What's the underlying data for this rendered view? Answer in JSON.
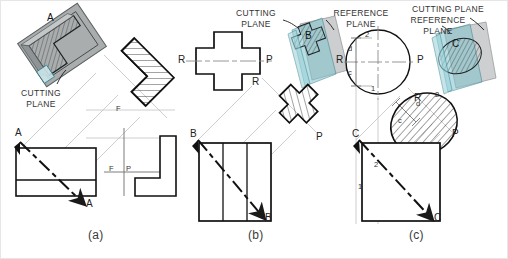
{
  "figure": {
    "panels": [
      {
        "id": "a",
        "caption": "(a)",
        "object": "L-shaped block",
        "pictorial_labels": [
          "A"
        ],
        "annotations": [
          "CUTTING PLANE"
        ],
        "cutting_plane_label": "A",
        "cutting_plane_ends": [
          "A",
          "A"
        ],
        "fold_line_labels": [
          "F",
          "F",
          "P"
        ],
        "section_view": "hatched L-shaped auxiliary section"
      },
      {
        "id": "b",
        "caption": "(b)",
        "object": "Cross / plus-shaped block",
        "pictorial_labels": [
          "B"
        ],
        "annotations": [
          "CUTTING PLANE",
          "REFERENCE PLANE"
        ],
        "cutting_plane_label": "B",
        "cutting_plane_ends": [
          "B",
          "B"
        ],
        "reference_line_labels": [
          "R",
          "P",
          "R",
          "R",
          "P"
        ],
        "section_view": "hatched cross-shaped auxiliary section"
      },
      {
        "id": "c",
        "caption": "(c)",
        "object": "Cylinder / circular block",
        "pictorial_labels": [
          "C"
        ],
        "annotations": [
          "CUTTING PLANE",
          "REFERENCE PLANE"
        ],
        "cutting_plane_label": "C",
        "cutting_plane_ends": [
          "C",
          "C"
        ],
        "reference_line_labels": [
          "R",
          "P",
          "R",
          "P"
        ],
        "dimension_labels": [
          "d",
          "c",
          "d",
          "c"
        ],
        "point_labels": [
          "1",
          "2",
          "1",
          "2",
          "1",
          "2"
        ],
        "section_view": "hatched elliptical auxiliary section"
      }
    ],
    "text": {
      "cutting_plane": "CUTTING",
      "cutting_plane2": "PLANE",
      "cutting_plane_one_line": "CUTTING PLANE",
      "reference_plane": "REFERENCE",
      "reference_plane2": "PLANE",
      "caption_a": "(a)",
      "caption_b": "(b)",
      "caption_c": "(c)",
      "letter_A": "A",
      "letter_B": "B",
      "letter_C": "C",
      "letter_R": "R",
      "letter_P": "P",
      "letter_F": "F",
      "letter_d": "d",
      "letter_c": "c",
      "num_1": "1",
      "num_2": "2"
    },
    "colors": {
      "line": "#1a1a1a",
      "thin_line": "#9a9a9a",
      "projection_line": "#c2c2c2",
      "plane_teal": "#7fc4cd",
      "plane_teal_edge": "#2f7f8c",
      "plane_gray": "#b9bcbd",
      "plane_gray_edge": "#6f7476",
      "solid_gray": "#a9adae",
      "background": "#ffffff",
      "text": "#2b2b2b"
    }
  }
}
